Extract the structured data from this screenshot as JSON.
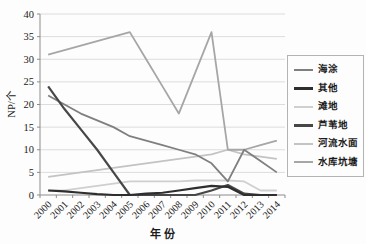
{
  "figure": {
    "background": "#fdfdfd",
    "grid_color": "#dcdcdc",
    "axis_color": "#8c8c8c",
    "text_color": "#1a1a1a"
  },
  "chart_data": {
    "type": "line",
    "title": "",
    "xlabel": "年 份",
    "ylabel": "NP/个",
    "ylim": [
      0,
      40
    ],
    "ytick_step": 5,
    "grid": "horizontal",
    "legend_position": "right",
    "categories": [
      "2000",
      "2001",
      "2002",
      "2003",
      "2004",
      "2005",
      "2006",
      "2007",
      "2008",
      "2009",
      "2010",
      "2011",
      "2012",
      "2013",
      "2014"
    ],
    "series": [
      {
        "name": "海涂",
        "color": "#7f7f7f",
        "values": [
          22,
          20,
          18,
          16.5,
          15,
          13,
          12,
          11,
          10,
          9,
          7,
          3,
          10,
          7.5,
          5
        ]
      },
      {
        "name": "其他",
        "color": "#2e2e2e",
        "values": [
          1,
          0.8,
          0.5,
          0.2,
          0,
          0,
          0.3,
          0.5,
          1,
          1.5,
          2,
          1.8,
          0,
          0,
          0
        ]
      },
      {
        "name": "滩地",
        "color": "#cfcfcf",
        "values": [
          1,
          1,
          1.5,
          2,
          2.5,
          3,
          3,
          3,
          3,
          3.2,
          3.2,
          3.2,
          3,
          1,
          1
        ]
      },
      {
        "name": "芦苇地",
        "color": "#474747",
        "values": [
          24,
          19,
          14.5,
          10,
          5,
          0,
          0,
          0,
          0,
          0,
          1,
          2.2,
          0.3,
          0,
          0
        ]
      },
      {
        "name": "河流水面",
        "color": "#c3c3c3",
        "values": [
          4,
          4.5,
          5,
          5.5,
          6,
          6.5,
          7,
          7.5,
          8,
          8.5,
          9,
          10,
          9,
          8.5,
          8
        ]
      },
      {
        "name": "水库坑塘",
        "color": "#a6a6a6",
        "values": [
          31,
          32,
          33,
          34,
          35,
          36,
          30,
          24,
          18,
          27,
          36,
          10,
          10,
          11,
          12
        ]
      }
    ]
  }
}
